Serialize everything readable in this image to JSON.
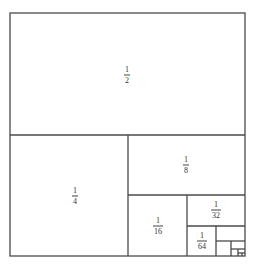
{
  "diagram": {
    "title": "",
    "colors": {
      "stroke": "#4a4a4a",
      "background": "#ffffff",
      "text": "#333333"
    },
    "outer": {
      "x": 10,
      "y": 13,
      "w": 235,
      "h": 243
    },
    "regions": [
      {
        "id": "half",
        "label_num": "1",
        "label_den": "2",
        "x": 10,
        "y": 13,
        "w": 235,
        "h": 122,
        "cx": 127,
        "cy": 75
      },
      {
        "id": "quarter",
        "label_num": "1",
        "label_den": "4",
        "x": 10,
        "y": 135,
        "w": 118,
        "h": 121,
        "cx": 75,
        "cy": 196
      },
      {
        "id": "eighth",
        "label_num": "1",
        "label_den": "8",
        "x": 128,
        "y": 135,
        "w": 117,
        "h": 60,
        "cx": 186,
        "cy": 165
      },
      {
        "id": "sixteenth",
        "label_num": "1",
        "label_den": "16",
        "x": 128,
        "y": 195,
        "w": 59,
        "h": 61,
        "cx": 158,
        "cy": 226
      },
      {
        "id": "thirty-second",
        "label_num": "1",
        "label_den": "32",
        "x": 187,
        "y": 195,
        "w": 58,
        "h": 31,
        "cx": 216,
        "cy": 210
      },
      {
        "id": "sixty-fourth",
        "label_num": "1",
        "label_den": "64",
        "x": 187,
        "y": 226,
        "w": 29,
        "h": 30,
        "cx": 202,
        "cy": 241
      },
      {
        "id": "1-128",
        "label_num": "",
        "label_den": "",
        "x": 216,
        "y": 226,
        "w": 29,
        "h": 15
      },
      {
        "id": "1-256",
        "label_num": "",
        "label_den": "",
        "x": 216,
        "y": 241,
        "w": 15,
        "h": 15
      },
      {
        "id": "1-512",
        "label_num": "",
        "label_den": "",
        "x": 231,
        "y": 241,
        "w": 14,
        "h": 8
      },
      {
        "id": "1-1024",
        "label_num": "",
        "label_den": "",
        "x": 231,
        "y": 249,
        "w": 7,
        "h": 7
      },
      {
        "id": "1-2048",
        "label_num": "",
        "label_den": "",
        "x": 238,
        "y": 249,
        "w": 7,
        "h": 4
      },
      {
        "id": "1-4096",
        "label_num": "",
        "label_den": "",
        "x": 238,
        "y": 253,
        "w": 4,
        "h": 3
      }
    ],
    "labels": {
      "half": {
        "num": "1",
        "den": "2"
      },
      "quarter": {
        "num": "1",
        "den": "4"
      },
      "eighth": {
        "num": "1",
        "den": "8"
      },
      "sixteenth": {
        "num": "1",
        "den": "16"
      },
      "thirty_second": {
        "num": "1",
        "den": "32"
      },
      "sixty_fourth": {
        "num": "1",
        "den": "64"
      }
    }
  }
}
